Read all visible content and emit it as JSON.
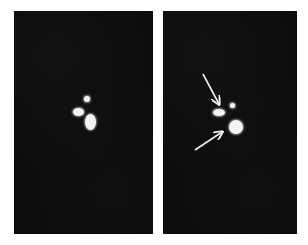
{
  "figure": {
    "panels": [
      {
        "id": "left",
        "description": "Dark image with three bright spots",
        "spots": [
          {
            "name": "spot-oval",
            "x": 59,
            "y": 97,
            "w": 11,
            "h": 8
          },
          {
            "name": "spot-small",
            "x": 70,
            "y": 85,
            "w": 6,
            "h": 6
          },
          {
            "name": "spot-large",
            "x": 71,
            "y": 103,
            "w": 11,
            "h": 16
          }
        ]
      },
      {
        "id": "right",
        "description": "Same image with two arrows pointing at bright spots",
        "spots": [
          {
            "name": "spot-oval",
            "x": 50,
            "y": 98,
            "w": 12,
            "h": 7
          },
          {
            "name": "spot-small",
            "x": 67,
            "y": 92,
            "w": 5,
            "h": 5
          },
          {
            "name": "spot-large",
            "x": 66,
            "y": 109,
            "w": 14,
            "h": 14
          }
        ],
        "arrows": [
          {
            "name": "arrow-upper",
            "from": [
              40,
              63
            ],
            "to": [
              56,
              93
            ]
          },
          {
            "name": "arrow-lower",
            "from": [
              32,
              139
            ],
            "to": [
              59,
              121
            ]
          }
        ]
      }
    ],
    "colors": {
      "background": "#ffffff",
      "panel": "#0b0b0b",
      "spot": "#f4f4f4",
      "arrow": "#f0f0f0"
    }
  }
}
